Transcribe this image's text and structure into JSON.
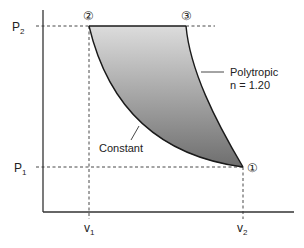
{
  "diagram": {
    "type": "P-v process diagram",
    "axes": {
      "y_ticks": [
        {
          "id": "p2",
          "label": "P",
          "sub": "2"
        },
        {
          "id": "p1",
          "label": "P",
          "sub": "1"
        }
      ],
      "x_ticks": [
        {
          "id": "v1",
          "label": "v",
          "sub": "1"
        },
        {
          "id": "v2",
          "label": "v",
          "sub": "2"
        }
      ]
    },
    "states": [
      {
        "id": "state-1",
        "label": "①",
        "p": "P1",
        "v": "v2"
      },
      {
        "id": "state-2",
        "label": "②",
        "p": "P2",
        "v": "v1"
      },
      {
        "id": "state-3",
        "label": "③",
        "p": "P2",
        "v": "between v1 and v2"
      }
    ],
    "processes": [
      {
        "id": "constant",
        "from": "state-1",
        "to": "state-2",
        "label": "Constant"
      },
      {
        "id": "polytropic",
        "from": "state-1",
        "to": "state-3",
        "label_line1": "Polytropic",
        "label_line2": "n = 1.20"
      },
      {
        "id": "isobaric",
        "from": "state-2",
        "to": "state-3",
        "label": ""
      }
    ],
    "shaded_region": {
      "fill_top": "#dcdcdc",
      "fill_bottom": "#6e6e6e"
    }
  }
}
